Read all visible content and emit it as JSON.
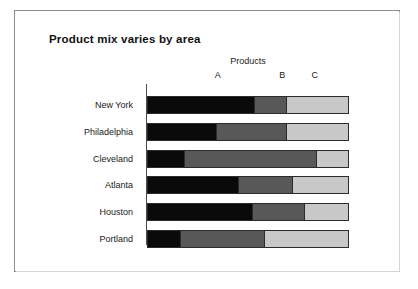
{
  "title": "Product mix varies by area",
  "group_label": "Products",
  "chart_data": {
    "type": "bar",
    "title": "Product mix varies by area",
    "subtitle": "",
    "orientation": "horizontal",
    "stacked": true,
    "normalized": true,
    "xlabel": "Products",
    "ylabel": "",
    "xlim": [
      0,
      100
    ],
    "grid": false,
    "legend_position": "top-inline-labels",
    "categories": [
      "New York",
      "Philadelphia",
      "Cleveland",
      "Atlanta",
      "Houston",
      "Portland"
    ],
    "series": [
      {
        "name": "A",
        "color": "#0a0a0a",
        "values": [
          53,
          34,
          18,
          45,
          52,
          16
        ]
      },
      {
        "name": "B",
        "color": "#585858",
        "values": [
          16,
          35,
          66,
          27,
          26,
          42
        ]
      },
      {
        "name": "C",
        "color": "#c8c8c8",
        "values": [
          31,
          31,
          16,
          28,
          22,
          42
        ]
      }
    ],
    "series_label_positions": [
      35,
      67,
      83
    ],
    "axis_color": "#4a4a4a",
    "bar_outline_color": "#2b2b2b"
  }
}
